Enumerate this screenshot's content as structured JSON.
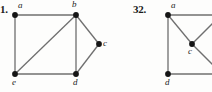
{
  "page": {
    "width": 212,
    "height": 92,
    "background": "#fdfdfc",
    "edge_color": "#6f6f6f",
    "vertex_color": "#151515"
  },
  "figures": [
    {
      "number_label": "1.",
      "number_pos": {
        "x": 0,
        "y": 3
      },
      "vertices": [
        {
          "id": "a",
          "label": "a",
          "x": 15,
          "y": 15,
          "label_x": 18,
          "label_y": 1
        },
        {
          "id": "b",
          "label": "b",
          "x": 76,
          "y": 15,
          "label_x": 72,
          "label_y": 0
        },
        {
          "id": "c",
          "label": "c",
          "x": 99,
          "y": 44,
          "label_x": 103,
          "label_y": 39
        },
        {
          "id": "d",
          "label": "d",
          "x": 76,
          "y": 74,
          "label_x": 73,
          "label_y": 78
        },
        {
          "id": "e",
          "label": "e",
          "x": 15,
          "y": 74,
          "label_x": 12,
          "label_y": 78
        }
      ],
      "edges": [
        {
          "from": "a",
          "to": "b"
        },
        {
          "from": "a",
          "to": "e"
        },
        {
          "from": "b",
          "to": "e"
        },
        {
          "from": "b",
          "to": "d"
        },
        {
          "from": "b",
          "to": "c"
        },
        {
          "from": "c",
          "to": "d"
        },
        {
          "from": "e",
          "to": "d"
        }
      ]
    },
    {
      "number_label": "32.",
      "number_pos": {
        "x": 133,
        "y": 3
      },
      "vertices": [
        {
          "id": "a",
          "label": "a",
          "x": 168,
          "y": 15,
          "label_x": 171,
          "label_y": 1
        },
        {
          "id": "c",
          "label": "c",
          "x": 192,
          "y": 44,
          "label_x": 188,
          "label_y": 47
        },
        {
          "id": "d",
          "label": "d",
          "x": 168,
          "y": 74,
          "label_x": 165,
          "label_y": 78
        }
      ],
      "edges": [
        {
          "from": "a",
          "to": "d"
        },
        {
          "from": "a",
          "to": "c"
        },
        {
          "from": "a",
          "to_point": {
            "x": 215,
            "y": 15
          }
        },
        {
          "from": "d",
          "to_point": {
            "x": 215,
            "y": 74
          }
        },
        {
          "from": "c",
          "to_point": {
            "x": 215,
            "y": 21
          }
        },
        {
          "from": "c",
          "to_point": {
            "x": 215,
            "y": 67
          }
        }
      ]
    }
  ]
}
